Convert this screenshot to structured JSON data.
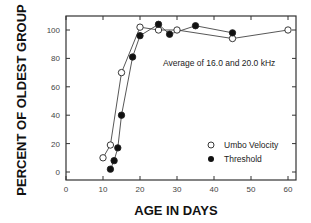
{
  "chart_data": {
    "type": "line",
    "title": "",
    "annotation": "Average of 16.0 and 20.0 kHz",
    "xlabel": "AGE IN DAYS",
    "ylabel": "PERCENT OF OLDEST GROUP",
    "xlim": [
      0,
      62
    ],
    "ylim": [
      -5,
      110
    ],
    "xticks": [
      0,
      10,
      20,
      30,
      40,
      50,
      60
    ],
    "yticks": [
      0,
      20,
      40,
      60,
      80,
      100
    ],
    "grid": false,
    "legend_position": "lower right",
    "series": [
      {
        "name": "Umbo Velocity",
        "marker": "open-circle",
        "x": [
          10,
          12,
          15,
          20,
          25,
          30,
          45,
          60
        ],
        "y": [
          10,
          19,
          70,
          102,
          100,
          100,
          94,
          100
        ]
      },
      {
        "name": "Threshold",
        "marker": "filled-circle",
        "x": [
          12,
          13,
          14,
          15,
          18,
          20,
          25,
          28,
          35,
          45
        ],
        "y": [
          2,
          8,
          17,
          40,
          81,
          96,
          104,
          97,
          103,
          98
        ]
      }
    ]
  }
}
